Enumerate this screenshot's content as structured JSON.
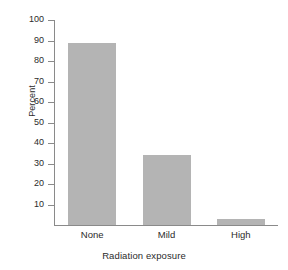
{
  "chart_data": {
    "type": "bar",
    "title": "",
    "xlabel": "Radiation exposure",
    "ylabel": "Percent",
    "categories": [
      "None",
      "Mild",
      "High"
    ],
    "values": [
      89,
      34,
      3
    ],
    "ylim": [
      0,
      100
    ],
    "yticks": [
      100,
      90,
      80,
      70,
      60,
      50,
      40,
      30,
      20,
      10
    ],
    "ytick_labels": [
      "100",
      "90",
      "80",
      "70",
      "60",
      "50",
      "40",
      "30",
      "20",
      "10"
    ],
    "grid": false,
    "legend": false,
    "bar_color": "#b4b4b4",
    "axis_color": "#8a8a8a",
    "text_color": "#2b2b2b",
    "background": "#ffffff"
  },
  "axes": {
    "y_title": "Percent",
    "x_title": "Radiation exposure"
  },
  "yticks": [
    {
      "label": "100"
    },
    {
      "label": "90"
    },
    {
      "label": "80"
    },
    {
      "label": "70"
    },
    {
      "label": "60"
    },
    {
      "label": "50"
    },
    {
      "label": "40"
    },
    {
      "label": "30"
    },
    {
      "label": "20"
    },
    {
      "label": "10"
    }
  ],
  "bars": [
    {
      "label": "None",
      "value": 89
    },
    {
      "label": "Mild",
      "value": 34
    },
    {
      "label": "High",
      "value": 3
    }
  ]
}
